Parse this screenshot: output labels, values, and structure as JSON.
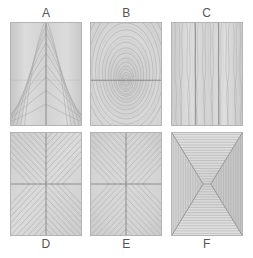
{
  "figure": {
    "background_color": "#ffffff",
    "panel_base_color": "#d5d5d5",
    "panel_border_color": "#b4b4b4",
    "grain_line_color": "#9a9a9a",
    "seam_line_color": "#7a7a7a",
    "label_color": "#555555",
    "panel_count": 6,
    "rows": 2,
    "columns": 3
  },
  "panels": [
    {
      "id": "A",
      "label": "A",
      "row": "top",
      "position": 1,
      "pattern": "cathedral-arch-grain",
      "description": "Plain-sawn cathedral arch figure, book-matched about a single vertical centre seam",
      "seams": [
        "vertical-center"
      ]
    },
    {
      "id": "B",
      "label": "B",
      "row": "top",
      "position": 2,
      "pattern": "concentric-oval-rings",
      "description": "Concentric elliptical growth rings centred slightly below middle, crossed by a horizontal seam",
      "seams": [
        "horizontal-center"
      ]
    },
    {
      "id": "C",
      "label": "C",
      "row": "top",
      "position": 3,
      "pattern": "vertical-straight-grain",
      "description": "Quarter-sawn near-vertical wavy straight grain divided into three staves by two vertical seams",
      "seams": [
        "vertical-third",
        "vertical-two-third"
      ]
    },
    {
      "id": "D",
      "label": "D",
      "row": "bottom",
      "position": 1,
      "pattern": "chevron-herringbone-quadrants",
      "description": "Four-way book-matched chevron / herringbone quadrants meeting at the centre cross",
      "seams": [
        "vertical-center",
        "horizontal-center"
      ]
    },
    {
      "id": "E",
      "label": "E",
      "row": "bottom",
      "position": 2,
      "pattern": "radial-sunburst-diagonals",
      "description": "Diagonal grain radiating outward from the centre point in four mirrored quadrants",
      "seams": [
        "vertical-center",
        "horizontal-center"
      ]
    },
    {
      "id": "F",
      "label": "F",
      "row": "bottom",
      "position": 3,
      "pattern": "mitred-picture-frame",
      "description": "Mitred picture-frame layout: horizontal banding in top and bottom triangles, vertical banding in left and right triangles, converging to an hourglass at centre",
      "seams": [
        "diagonal-miters",
        "center-hourglass"
      ]
    }
  ]
}
